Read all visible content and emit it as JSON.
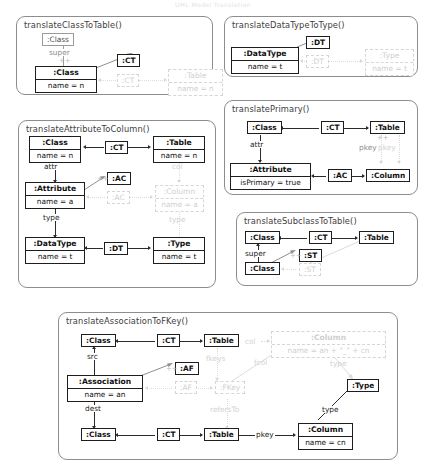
{
  "page": {
    "header_faint": "UML Model Translation"
  },
  "labels": {
    "super": "super",
    "attr": "attr",
    "type": "type",
    "col": "col",
    "src": "src",
    "dest": "dest",
    "pkey": "pkey",
    "fkeys": "fkeys",
    "fcol": "fcol",
    "refersTo": "refersTo",
    "plus": "++"
  },
  "rules": [
    {
      "id": "translateClassToTable",
      "title": "translateClassToTable()",
      "nodes": [
        {
          "name": "sup-class",
          "label": ":Class",
          "attr": null,
          "kind": "context-grey"
        },
        {
          "name": "ct-corr-top",
          "label": ":CT",
          "attr": null,
          "kind": "context"
        },
        {
          "name": "class",
          "label": ":Class",
          "attr": "name = n",
          "kind": "source"
        },
        {
          "name": "ct-corr-new",
          "label": ":CT",
          "attr": null,
          "kind": "created"
        },
        {
          "name": "table",
          "label": ":Table",
          "attr": "name = n",
          "kind": "created"
        }
      ],
      "edges": [
        {
          "label": "super",
          "from": "class",
          "to": "sup-class",
          "kind": "context"
        }
      ]
    },
    {
      "id": "translateDataTypeToType",
      "title": "translateDataTypeToType()",
      "nodes": [
        {
          "name": "dt-corr-top",
          "label": ":DT",
          "attr": null,
          "kind": "context"
        },
        {
          "name": "datatype",
          "label": ":DataType",
          "attr": "name = t",
          "kind": "source"
        },
        {
          "name": "dt-corr-new",
          "label": ":DT",
          "attr": null,
          "kind": "created"
        },
        {
          "name": "type",
          "label": ":Type",
          "attr": "name = t",
          "kind": "created"
        }
      ],
      "edges": []
    },
    {
      "id": "translateAttributeToColumn",
      "title": "translateAttributeToColumn()",
      "nodes": [
        {
          "name": "class",
          "label": ":Class",
          "attr": "name = n",
          "kind": "context"
        },
        {
          "name": "ct-corr",
          "label": ":CT",
          "attr": null,
          "kind": "context"
        },
        {
          "name": "table",
          "label": ":Table",
          "attr": "name = n",
          "kind": "context"
        },
        {
          "name": "ac-corr-top",
          "label": ":AC",
          "attr": null,
          "kind": "context"
        },
        {
          "name": "attribute",
          "label": ":Attribute",
          "attr": "name = a",
          "kind": "source"
        },
        {
          "name": "ac-corr-new",
          "label": ":AC",
          "attr": null,
          "kind": "created"
        },
        {
          "name": "column",
          "label": ":Column",
          "attr": "name = a",
          "kind": "created"
        },
        {
          "name": "datatype",
          "label": ":DataType",
          "attr": "name = t",
          "kind": "context"
        },
        {
          "name": "dt-corr",
          "label": ":DT",
          "attr": null,
          "kind": "context"
        },
        {
          "name": "type",
          "label": ":Type",
          "attr": "name = t",
          "kind": "context"
        }
      ],
      "edges": [
        {
          "label": "attr",
          "from": "class",
          "to": "attribute",
          "kind": "context"
        },
        {
          "label": "type",
          "from": "attribute",
          "to": "datatype",
          "kind": "context"
        },
        {
          "label": "col",
          "from": "table",
          "to": "column",
          "kind": "created"
        },
        {
          "label": "type",
          "from": "column",
          "to": "type",
          "kind": "created"
        }
      ]
    },
    {
      "id": "translatePrimary",
      "title": "translatePrimary()",
      "nodes": [
        {
          "name": "class",
          "label": ":Class",
          "attr": null,
          "kind": "context"
        },
        {
          "name": "ct-corr",
          "label": ":CT",
          "attr": null,
          "kind": "context"
        },
        {
          "name": "table",
          "label": ":Table",
          "attr": null,
          "kind": "context"
        },
        {
          "name": "attribute",
          "label": ":Attribute",
          "attr": "isPrimary = true",
          "kind": "source"
        },
        {
          "name": "ac-corr",
          "label": ":AC",
          "attr": null,
          "kind": "context"
        },
        {
          "name": "column",
          "label": ":Column",
          "attr": null,
          "kind": "context"
        }
      ],
      "edges": [
        {
          "label": "attr",
          "from": "class",
          "to": "attribute",
          "kind": "context"
        },
        {
          "label": "pkey",
          "from": "table",
          "to": "column",
          "kind": "created"
        }
      ]
    },
    {
      "id": "translateSubclassToTable",
      "title": "translateSubclassToTable()",
      "nodes": [
        {
          "name": "super-class",
          "label": ":Class",
          "attr": null,
          "kind": "context"
        },
        {
          "name": "ct-corr",
          "label": ":CT",
          "attr": null,
          "kind": "context"
        },
        {
          "name": "table",
          "label": ":Table",
          "attr": null,
          "kind": "context"
        },
        {
          "name": "sub-class",
          "label": ":Class",
          "attr": null,
          "kind": "source"
        },
        {
          "name": "st-corr-top",
          "label": ":ST",
          "attr": null,
          "kind": "context"
        },
        {
          "name": "st-corr-new",
          "label": ":ST",
          "attr": null,
          "kind": "created"
        }
      ],
      "edges": [
        {
          "label": "super",
          "from": "sub-class",
          "to": "super-class",
          "kind": "context"
        }
      ]
    },
    {
      "id": "translateAssociationToFKey",
      "title": "translateAssociationToFKey()",
      "nodes": [
        {
          "name": "src-class",
          "label": ":Class",
          "attr": null,
          "kind": "context"
        },
        {
          "name": "ct-corr-src",
          "label": ":CT",
          "attr": null,
          "kind": "context"
        },
        {
          "name": "src-table",
          "label": ":Table",
          "attr": null,
          "kind": "context"
        },
        {
          "name": "af-corr-top",
          "label": ":AF",
          "attr": null,
          "kind": "context"
        },
        {
          "name": "association",
          "label": ":Association",
          "attr": "name = an",
          "kind": "source"
        },
        {
          "name": "af-corr-new",
          "label": ":AF",
          "attr": null,
          "kind": "created"
        },
        {
          "name": "fkey",
          "label": ":FKey",
          "attr": null,
          "kind": "created"
        },
        {
          "name": "new-column",
          "label": ":Column",
          "attr": "name = an + \"_\" + cn",
          "kind": "created"
        },
        {
          "name": "dest-class",
          "label": ":Class",
          "attr": null,
          "kind": "context"
        },
        {
          "name": "ct-corr-dest",
          "label": ":CT",
          "attr": null,
          "kind": "context"
        },
        {
          "name": "dest-table",
          "label": ":Table",
          "attr": null,
          "kind": "context"
        },
        {
          "name": "pkey-column",
          "label": ":Column",
          "attr": "name = cn",
          "kind": "context"
        },
        {
          "name": "type",
          "label": ":Type",
          "attr": null,
          "kind": "context"
        }
      ],
      "edges": [
        {
          "label": "src",
          "from": "association",
          "to": "src-class",
          "kind": "context"
        },
        {
          "label": "dest",
          "from": "association",
          "to": "dest-class",
          "kind": "context"
        },
        {
          "label": "pkey",
          "from": "dest-table",
          "to": "pkey-column",
          "kind": "context"
        },
        {
          "label": "type",
          "from": "pkey-column",
          "to": "type",
          "kind": "context"
        },
        {
          "label": "col",
          "from": "src-table",
          "to": "new-column",
          "kind": "created"
        },
        {
          "label": "fkeys",
          "from": "src-table",
          "to": "fkey",
          "kind": "created"
        },
        {
          "label": "fcol",
          "from": "fkey",
          "to": "new-column",
          "kind": "created"
        },
        {
          "label": "refersTo",
          "from": "fkey",
          "to": "dest-table",
          "kind": "created"
        },
        {
          "label": "type",
          "from": "new-column",
          "to": "type",
          "kind": "created"
        }
      ]
    }
  ]
}
